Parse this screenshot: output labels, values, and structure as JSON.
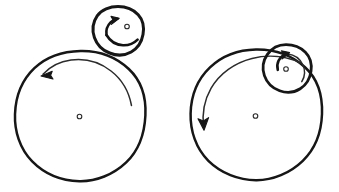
{
  "canvas": {
    "width": 339,
    "height": 192,
    "background": "#ffffff",
    "ink_color": "#161616",
    "style": "hand-drawn line art"
  },
  "figures": [
    {
      "id": "external-tangency",
      "label": "Small circle rolling on outside of large circle",
      "large_circle": {
        "label": "large circle",
        "cx": 80,
        "cy": 116,
        "r": 65,
        "center_mark": "small open dot",
        "rotation": "counterclockwise",
        "arrow_label": "counterclockwise rotation arrow"
      },
      "small_circle": {
        "label": "small circle",
        "cx": 118,
        "cy": 31,
        "r": 25,
        "center_mark": "small open dot",
        "rotation": "counterclockwise",
        "arrow_label": "counterclockwise rotation arrow",
        "tangency": "external"
      }
    },
    {
      "id": "internal-tangency",
      "label": "Small circle rolling on inside of large circle",
      "large_circle": {
        "label": "large circle",
        "cx": 256,
        "cy": 115,
        "r": 66,
        "center_mark": "small open dot",
        "rotation": "counterclockwise",
        "arrow_label": "counterclockwise rotation arrow"
      },
      "small_circle": {
        "label": "small circle",
        "cx": 286,
        "cy": 68,
        "r": 24,
        "center_mark": "small open dot",
        "rotation": "counterclockwise",
        "arrow_label": "counterclockwise rotation arrow",
        "tangency": "internal"
      }
    }
  ],
  "annotations": {
    "text_labels": [],
    "note": "no text labels present in drawing"
  }
}
